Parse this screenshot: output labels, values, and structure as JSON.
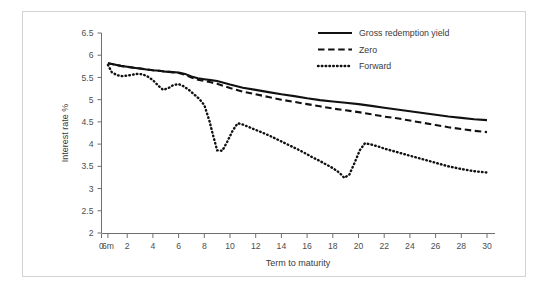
{
  "chart_data": {
    "type": "line",
    "title": "",
    "subtitle": "",
    "xlabel": "Term to maturity",
    "ylabel": "Interest rate %",
    "xlim": [
      0,
      30
    ],
    "ylim": [
      2,
      6.5
    ],
    "grid": false,
    "legend_position": "top-right",
    "x_tick_labels": [
      "0",
      "6m",
      "2",
      "4",
      "6",
      "8",
      "10",
      "12",
      "14",
      "16",
      "18",
      "20",
      "22",
      "24",
      "26",
      "28",
      "30"
    ],
    "x_tick_values": [
      0,
      0.5,
      2,
      4,
      6,
      8,
      10,
      12,
      14,
      16,
      18,
      20,
      22,
      24,
      26,
      28,
      30
    ],
    "y_tick_labels": [
      "2",
      "2.5",
      "3",
      "3.5",
      "4",
      "4.5",
      "5",
      "5.5",
      "6",
      "6.5"
    ],
    "y_tick_values": [
      2,
      2.5,
      3,
      3.5,
      4,
      4.5,
      5,
      5.5,
      6,
      6.5
    ],
    "series": [
      {
        "name": "Gross redemption yield",
        "style": "solid",
        "color": "#111111",
        "x": [
          0.5,
          1,
          1.5,
          2,
          2.5,
          3,
          3.5,
          4,
          4.5,
          5,
          5.5,
          6,
          6.5,
          7,
          7.5,
          8,
          8.5,
          9,
          9.5,
          10,
          11,
          12,
          13,
          14,
          15,
          16,
          17,
          18,
          19,
          20,
          21,
          22,
          23,
          24,
          25,
          26,
          27,
          28,
          29,
          30
        ],
        "y": [
          5.82,
          5.79,
          5.76,
          5.74,
          5.72,
          5.7,
          5.68,
          5.66,
          5.65,
          5.63,
          5.62,
          5.61,
          5.58,
          5.52,
          5.48,
          5.46,
          5.44,
          5.42,
          5.38,
          5.34,
          5.27,
          5.22,
          5.17,
          5.12,
          5.08,
          5.03,
          4.99,
          4.96,
          4.93,
          4.9,
          4.86,
          4.82,
          4.78,
          4.74,
          4.7,
          4.66,
          4.62,
          4.59,
          4.56,
          4.54
        ]
      },
      {
        "name": "Zero",
        "style": "dashed",
        "color": "#111111",
        "x": [
          0.5,
          1,
          1.5,
          2,
          2.5,
          3,
          3.5,
          4,
          4.5,
          5,
          5.5,
          6,
          6.5,
          7,
          7.5,
          8,
          8.5,
          9,
          9.5,
          10,
          11,
          12,
          13,
          14,
          15,
          16,
          17,
          18,
          19,
          20,
          21,
          22,
          23,
          24,
          25,
          26,
          27,
          28,
          29,
          30
        ],
        "y": [
          5.82,
          5.79,
          5.76,
          5.74,
          5.72,
          5.7,
          5.68,
          5.66,
          5.65,
          5.63,
          5.62,
          5.6,
          5.56,
          5.5,
          5.45,
          5.42,
          5.39,
          5.36,
          5.31,
          5.26,
          5.18,
          5.12,
          5.06,
          5.0,
          4.95,
          4.9,
          4.85,
          4.8,
          4.76,
          4.72,
          4.67,
          4.62,
          4.58,
          4.53,
          4.48,
          4.43,
          4.38,
          4.34,
          4.3,
          4.27
        ]
      },
      {
        "name": "Forward",
        "style": "dotted",
        "color": "#111111",
        "x": [
          0.5,
          0.8,
          1.2,
          1.6,
          2.0,
          2.4,
          2.8,
          3.2,
          3.6,
          4.0,
          4.4,
          4.8,
          5.2,
          5.6,
          6.0,
          6.4,
          6.8,
          7.2,
          7.6,
          8.0,
          8.4,
          8.7,
          9.0,
          9.4,
          9.8,
          10.2,
          10.6,
          11.0,
          11.5,
          12.0,
          12.5,
          13.0,
          13.5,
          14.0,
          14.5,
          15.0,
          15.5,
          16.0,
          16.5,
          17.0,
          17.5,
          18.0,
          18.5,
          18.9,
          19.3,
          19.7,
          20.1,
          20.5,
          21.0,
          21.5,
          22.0,
          22.5,
          23.0,
          24.0,
          25.0,
          26.0,
          27.0,
          28.0,
          29.0,
          30.0
        ],
        "y": [
          5.78,
          5.62,
          5.55,
          5.53,
          5.54,
          5.56,
          5.58,
          5.57,
          5.52,
          5.44,
          5.32,
          5.22,
          5.26,
          5.33,
          5.35,
          5.3,
          5.22,
          5.12,
          5.02,
          4.88,
          4.52,
          4.18,
          3.86,
          3.85,
          4.06,
          4.3,
          4.47,
          4.44,
          4.38,
          4.32,
          4.26,
          4.2,
          4.13,
          4.06,
          3.99,
          3.92,
          3.85,
          3.77,
          3.69,
          3.62,
          3.54,
          3.46,
          3.36,
          3.24,
          3.32,
          3.58,
          3.86,
          4.02,
          3.99,
          3.95,
          3.9,
          3.86,
          3.82,
          3.74,
          3.66,
          3.58,
          3.5,
          3.44,
          3.39,
          3.36
        ]
      }
    ],
    "legend": [
      {
        "label": "Gross redemption yield",
        "style": "solid"
      },
      {
        "label": "Zero",
        "style": "dashed"
      },
      {
        "label": "Forward",
        "style": "dotted"
      }
    ]
  },
  "colors": {
    "frame_border": "#d2d2d2",
    "axis": "#6f6f6f",
    "text": "#3a3a3a",
    "series": "#111111",
    "background": "#ffffff"
  }
}
